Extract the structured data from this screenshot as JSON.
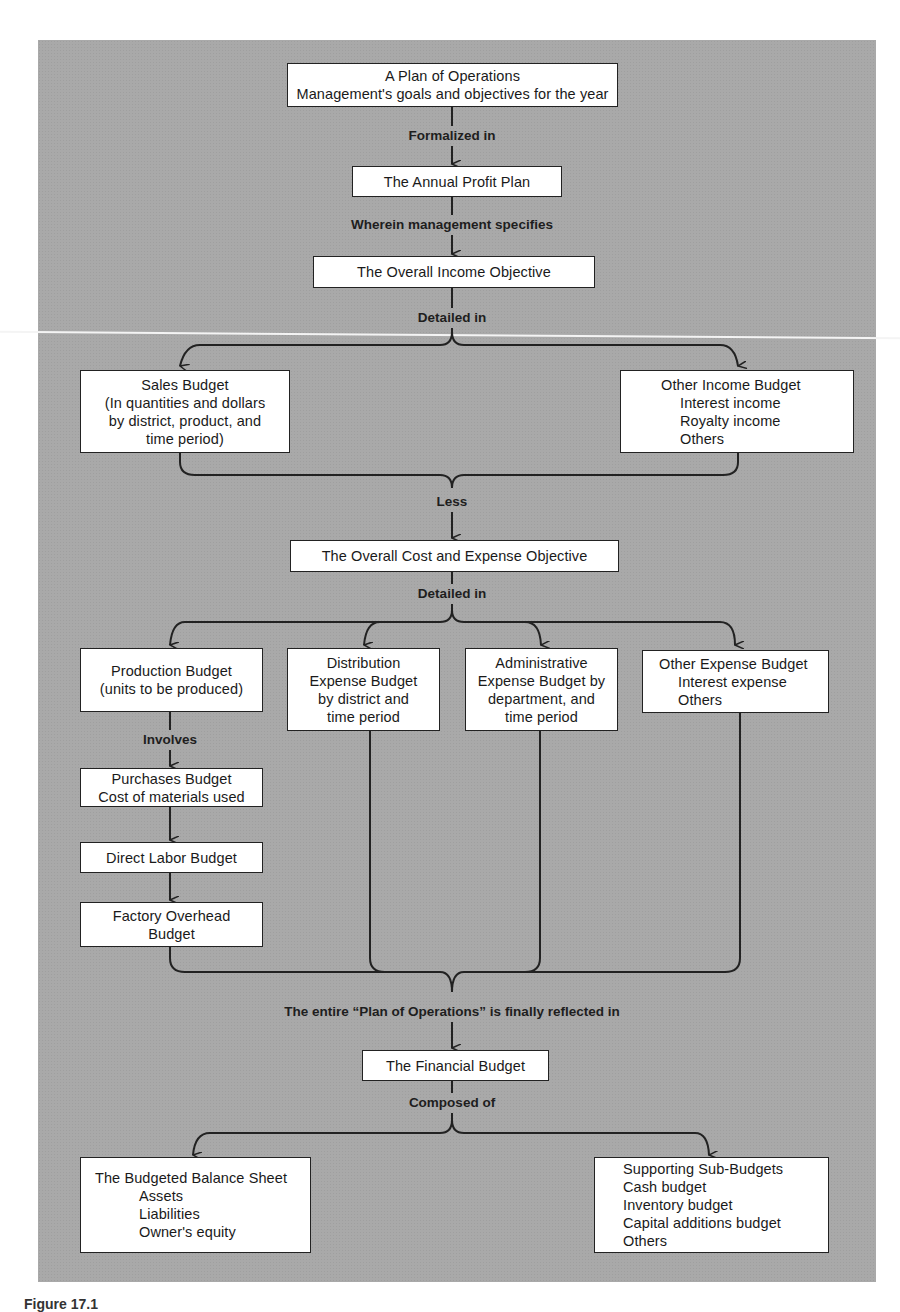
{
  "diagram": {
    "type": "flowchart",
    "nodes": {
      "plan": {
        "lines": [
          "A Plan of Operations",
          "Management's goals and objectives for the year"
        ]
      },
      "profit_plan": {
        "lines": [
          "The Annual Profit Plan"
        ]
      },
      "income_objective": {
        "lines": [
          "The Overall Income Objective"
        ]
      },
      "sales_budget": {
        "lines": [
          "Sales Budget",
          "(In quantities and dollars",
          "by district, product, and",
          "time period)"
        ]
      },
      "other_income": {
        "lines": [
          "Other Income Budget",
          "Interest income",
          "Royalty income",
          "Others"
        ]
      },
      "cost_objective": {
        "lines": [
          "The Overall Cost and  Expense Objective"
        ]
      },
      "production": {
        "lines": [
          "Production Budget",
          "(units to be produced)"
        ]
      },
      "distribution": {
        "lines": [
          "Distribution",
          "Expense Budget",
          "by district and",
          "time period"
        ]
      },
      "administrative": {
        "lines": [
          "Administrative",
          "Expense Budget by",
          "department, and",
          "time period"
        ]
      },
      "other_expense": {
        "lines": [
          "Other Expense Budget",
          "Interest expense",
          "Others"
        ]
      },
      "purchases": {
        "lines": [
          "Purchases Budget",
          "Cost of materials used"
        ]
      },
      "direct_labor": {
        "lines": [
          "Direct Labor Budget"
        ]
      },
      "factory_overhead": {
        "lines": [
          "Factory Overhead",
          "Budget"
        ]
      },
      "financial_budget": {
        "lines": [
          "The Financial Budget"
        ]
      },
      "balance_sheet": {
        "lines": [
          "The Budgeted Balance Sheet",
          "Assets",
          "Liabilities",
          "Owner's equity"
        ]
      },
      "sub_budgets": {
        "lines": [
          "Supporting Sub-Budgets",
          "Cash budget",
          "Inventory budget",
          "Capital additions budget",
          "Others"
        ]
      }
    },
    "edge_labels": {
      "formalized_in": "Formalized in",
      "wherein": "Wherein management specifies",
      "detailed_in_1": "Detailed in",
      "less": "Less",
      "detailed_in_2": "Detailed in",
      "involves": "Involves",
      "reflected_in": "The entire “Plan of Operations” is finally reflected in",
      "composed_of": "Composed of"
    },
    "edges": [
      [
        "plan",
        "profit_plan",
        "Formalized in"
      ],
      [
        "profit_plan",
        "income_objective",
        "Wherein management specifies"
      ],
      [
        "income_objective",
        "sales_budget",
        "Detailed in"
      ],
      [
        "income_objective",
        "other_income",
        "Detailed in"
      ],
      [
        "sales_budget",
        "cost_objective",
        "Less"
      ],
      [
        "other_income",
        "cost_objective",
        "Less"
      ],
      [
        "cost_objective",
        "production",
        "Detailed in"
      ],
      [
        "cost_objective",
        "distribution",
        "Detailed in"
      ],
      [
        "cost_objective",
        "administrative",
        "Detailed in"
      ],
      [
        "cost_objective",
        "other_expense",
        "Detailed in"
      ],
      [
        "production",
        "purchases",
        "Involves"
      ],
      [
        "purchases",
        "direct_labor",
        ""
      ],
      [
        "direct_labor",
        "factory_overhead",
        ""
      ],
      [
        "factory_overhead",
        "financial_budget",
        "The entire “Plan of Operations” is finally reflected in"
      ],
      [
        "distribution",
        "financial_budget",
        ""
      ],
      [
        "administrative",
        "financial_budget",
        ""
      ],
      [
        "other_expense",
        "financial_budget",
        ""
      ],
      [
        "financial_budget",
        "balance_sheet",
        "Composed of"
      ],
      [
        "financial_budget",
        "sub_budgets",
        "Composed of"
      ]
    ]
  },
  "caption": {
    "text": "Figure 17.1"
  },
  "colors": {
    "panel": "#a9a9a9",
    "box": "#ffffff",
    "line": "#222222"
  }
}
